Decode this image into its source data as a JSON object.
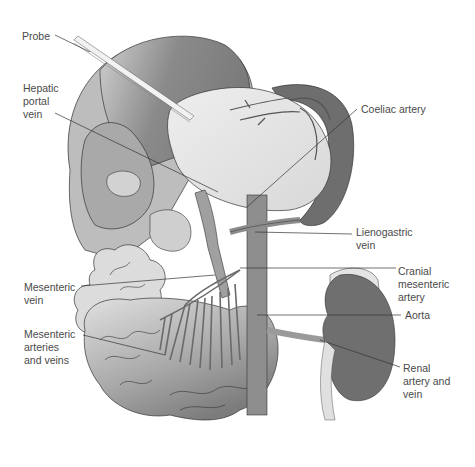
{
  "figure": {
    "colors": {
      "background": "#ffffff",
      "liver_dark": "#8c8c8c",
      "liver_light": "#c8c8c8",
      "stomach": "#e2e2e2",
      "spleen": "#6e6e6e",
      "intestine_light": "#d6d6d6",
      "intestine_dark": "#8a8a8a",
      "vessel": "#9a9a9a",
      "aorta": "#8e8e8e",
      "kidney": "#6f6f6f",
      "label_text": "#4a4a4a",
      "leader_line": "#333333"
    },
    "labels": [
      {
        "id": "probe",
        "text": "Probe",
        "x": 22,
        "y": 30
      },
      {
        "id": "hepatic-portal-vein",
        "text": "Hepatic\nportal\nvein",
        "x": 23,
        "y": 82
      },
      {
        "id": "coeliac-artery",
        "text": "Coeliac artery",
        "x": 361,
        "y": 103
      },
      {
        "id": "lienogastric-vein",
        "text": "Lienogastric\nvein",
        "x": 356,
        "y": 226
      },
      {
        "id": "cranial-mesenteric-artery",
        "text": "Cranial\nmesenteric\nartery",
        "x": 398,
        "y": 265
      },
      {
        "id": "aorta",
        "text": "Aorta",
        "x": 405,
        "y": 309
      },
      {
        "id": "renal-artery-and-vein",
        "text": "Renal\nartery and\nvein",
        "x": 403,
        "y": 362
      },
      {
        "id": "mesenteric-vein",
        "text": "Mesenteric\nvein",
        "x": 24,
        "y": 281
      },
      {
        "id": "mesenteric-arteries-and-veins",
        "text": "Mesenteric\narteries\nand veins",
        "x": 24,
        "y": 328
      }
    ]
  }
}
